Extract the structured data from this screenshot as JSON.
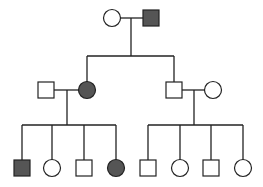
{
  "diagram": {
    "type": "pedigree-chart",
    "colors": {
      "affected": "#555555",
      "unaffected": "#ffffff",
      "stroke": "#222222",
      "background": "#ffffff"
    },
    "legend": {
      "square": "male",
      "circle": "female",
      "filled": "affected",
      "unfilled": "unaffected"
    },
    "generations": [
      {
        "label": "I",
        "individuals": [
          {
            "id": "I-1",
            "sex": "female",
            "affected": false,
            "cx": 112,
            "cy": 18
          },
          {
            "id": "I-2",
            "sex": "male",
            "affected": true,
            "cx": 151,
            "cy": 18
          }
        ]
      },
      {
        "label": "II",
        "individuals": [
          {
            "id": "II-1",
            "sex": "male",
            "affected": false,
            "cx": 46,
            "cy": 90,
            "spouse_of": "II-2"
          },
          {
            "id": "II-2",
            "sex": "female",
            "affected": true,
            "cx": 87,
            "cy": 90,
            "parents": "I"
          },
          {
            "id": "II-3",
            "sex": "male",
            "affected": false,
            "cx": 174,
            "cy": 90,
            "parents": "I"
          },
          {
            "id": "II-4",
            "sex": "female",
            "affected": false,
            "cx": 213,
            "cy": 90,
            "spouse_of": "II-3"
          }
        ]
      },
      {
        "label": "III",
        "individuals": [
          {
            "id": "III-1",
            "sex": "male",
            "affected": true,
            "cx": 22,
            "cy": 168,
            "parents": "II-1+II-2"
          },
          {
            "id": "III-2",
            "sex": "female",
            "affected": false,
            "cx": 52,
            "cy": 168,
            "parents": "II-1+II-2"
          },
          {
            "id": "III-3",
            "sex": "male",
            "affected": false,
            "cx": 84,
            "cy": 168,
            "parents": "II-1+II-2"
          },
          {
            "id": "III-4",
            "sex": "female",
            "affected": true,
            "cx": 116,
            "cy": 168,
            "parents": "II-1+II-2"
          },
          {
            "id": "III-5",
            "sex": "male",
            "affected": false,
            "cx": 148,
            "cy": 168,
            "parents": "II-3+II-4"
          },
          {
            "id": "III-6",
            "sex": "female",
            "affected": false,
            "cx": 180,
            "cy": 168,
            "parents": "II-3+II-4"
          },
          {
            "id": "III-7",
            "sex": "male",
            "affected": false,
            "cx": 211,
            "cy": 168,
            "parents": "II-3+II-4"
          },
          {
            "id": "III-8",
            "sex": "female",
            "affected": false,
            "cx": 243,
            "cy": 168,
            "parents": "II-3+II-4"
          }
        ]
      }
    ],
    "lines": {
      "marriage_I": {
        "x1": 120,
        "y1": 18,
        "x2": 143,
        "y2": 18
      },
      "descent_I": {
        "x1": 131,
        "y1": 18,
        "x2": 131,
        "y2": 56
      },
      "sibship_II": {
        "x1": 87,
        "y1": 56,
        "x2": 174,
        "y2": 56
      },
      "drop_II2": {
        "x1": 87,
        "y1": 56,
        "x2": 87,
        "y2": 82
      },
      "drop_II3": {
        "x1": 174,
        "y1": 56,
        "x2": 174,
        "y2": 83
      },
      "marriage_II_left": {
        "x1": 54,
        "y1": 90,
        "x2": 79,
        "y2": 90
      },
      "descent_II_left": {
        "x1": 67,
        "y1": 90,
        "x2": 67,
        "y2": 125
      },
      "sibship_III_left": {
        "x1": 22,
        "y1": 125,
        "x2": 116,
        "y2": 125
      },
      "marriage_II_right": {
        "x1": 181,
        "y1": 90,
        "x2": 205,
        "y2": 90
      },
      "descent_II_right": {
        "x1": 194,
        "y1": 90,
        "x2": 194,
        "y2": 125
      },
      "sibship_III_right": {
        "x1": 148,
        "y1": 125,
        "x2": 243,
        "y2": 125
      }
    },
    "symbol_size": 16,
    "gen3_drop_top": 125,
    "gen3_drop_bottom": 160
  }
}
